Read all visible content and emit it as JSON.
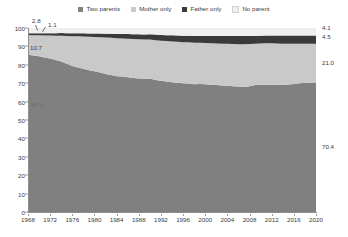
{
  "legend": {
    "position": "top-center",
    "items": [
      {
        "label": "Two parents",
        "color": "#808080",
        "icon": "square-swatch-icon"
      },
      {
        "label": "Mother only",
        "color": "#c9c9c9",
        "icon": "square-swatch-icon"
      },
      {
        "label": "Father only",
        "color": "#3a3a3a",
        "icon": "square-swatch-icon"
      },
      {
        "label": "No parent",
        "color": "#efefef",
        "icon": "square-swatch-icon"
      }
    ]
  },
  "axes": {
    "y_ticks": [
      "0",
      "10",
      "20",
      "30",
      "40",
      "50",
      "60",
      "70",
      "80",
      "90",
      "100"
    ],
    "x_ticks": [
      "1968",
      "1972",
      "1976",
      "1980",
      "1984",
      "1988",
      "1992",
      "1996",
      "2000",
      "2004",
      "2008",
      "2012",
      "2016",
      "2020"
    ]
  },
  "annotations": {
    "start": [
      {
        "name": "no-parent-start",
        "text": "2.8"
      },
      {
        "name": "father-only-start",
        "text": "1.1"
      },
      {
        "name": "mother-only-start",
        "text": "10.7"
      },
      {
        "name": "two-parents-start",
        "text": "85.4"
      }
    ],
    "end": [
      {
        "name": "no-parent-end",
        "text": "4.1"
      },
      {
        "name": "father-only-end",
        "text": "4.5"
      },
      {
        "name": "mother-only-end",
        "text": "21.0"
      },
      {
        "name": "two-parents-end",
        "text": "70.4"
      }
    ]
  },
  "chart_data": {
    "type": "area",
    "title": "",
    "subtitle": "",
    "xlabel": "",
    "ylabel": "",
    "xlim": [
      1968,
      2020
    ],
    "ylim": [
      0,
      100
    ],
    "grid": false,
    "stacked": true,
    "stack_order_bottom_to_top": [
      "Two parents",
      "Mother only",
      "Father only",
      "No parent"
    ],
    "legend_position": "top-center",
    "x": [
      1968,
      1969,
      1970,
      1971,
      1972,
      1973,
      1974,
      1975,
      1976,
      1977,
      1978,
      1979,
      1980,
      1981,
      1982,
      1983,
      1984,
      1985,
      1986,
      1987,
      1988,
      1989,
      1990,
      1991,
      1992,
      1993,
      1994,
      1995,
      1996,
      1997,
      1998,
      1999,
      2000,
      2001,
      2002,
      2003,
      2004,
      2005,
      2006,
      2007,
      2008,
      2009,
      2010,
      2011,
      2012,
      2013,
      2014,
      2015,
      2016,
      2017,
      2018,
      2019,
      2020
    ],
    "series": [
      {
        "name": "Two parents",
        "color": "#808080",
        "start_value": 85.4,
        "end_value": 70.4,
        "values": [
          85.4,
          85.0,
          84.6,
          84.0,
          83.4,
          82.6,
          81.8,
          80.6,
          79.4,
          78.6,
          77.8,
          77.0,
          76.5,
          75.8,
          75.0,
          74.4,
          73.8,
          73.6,
          73.2,
          72.8,
          72.6,
          72.4,
          72.5,
          71.8,
          71.3,
          70.9,
          70.5,
          70.2,
          70.0,
          69.8,
          69.4,
          69.6,
          69.4,
          69.2,
          69.0,
          68.8,
          68.6,
          68.4,
          68.2,
          68.0,
          68.4,
          69.0,
          69.2,
          69.1,
          69.0,
          69.1,
          69.2,
          69.3,
          69.6,
          70.0,
          70.2,
          70.3,
          70.4
        ]
      },
      {
        "name": "Mother only",
        "color": "#c9c9c9",
        "start_value": 10.7,
        "end_value": 21.0,
        "values": [
          10.7,
          11.0,
          11.4,
          11.9,
          12.5,
          13.2,
          14.0,
          15.0,
          16.1,
          16.9,
          17.6,
          18.2,
          18.6,
          19.2,
          19.8,
          20.3,
          20.6,
          20.7,
          21.0,
          21.2,
          21.3,
          21.3,
          21.2,
          21.6,
          21.8,
          22.0,
          22.2,
          22.3,
          22.3,
          22.4,
          22.6,
          22.4,
          22.4,
          22.5,
          22.6,
          22.7,
          22.8,
          22.9,
          23.0,
          23.2,
          22.9,
          22.5,
          22.4,
          22.6,
          22.7,
          22.5,
          22.3,
          22.2,
          21.9,
          21.5,
          21.3,
          21.1,
          21.0
        ]
      },
      {
        "name": "Father only",
        "color": "#3a3a3a",
        "start_value": 1.1,
        "end_value": 4.5,
        "values": [
          1.1,
          1.2,
          1.2,
          1.3,
          1.3,
          1.4,
          1.5,
          1.5,
          1.6,
          1.7,
          1.7,
          1.8,
          1.9,
          2.0,
          2.1,
          2.2,
          2.3,
          2.4,
          2.5,
          2.6,
          2.7,
          2.8,
          2.9,
          3.0,
          3.1,
          3.2,
          3.3,
          3.4,
          3.5,
          3.6,
          3.7,
          3.8,
          3.9,
          4.0,
          4.1,
          4.2,
          4.3,
          4.4,
          4.4,
          4.4,
          4.3,
          4.2,
          4.2,
          4.2,
          4.2,
          4.3,
          4.4,
          4.4,
          4.4,
          4.4,
          4.4,
          4.5,
          4.5
        ]
      },
      {
        "name": "No parent",
        "color": "#efefef",
        "start_value": 2.8,
        "end_value": 4.1,
        "values": [
          2.8,
          2.8,
          2.8,
          2.8,
          2.8,
          2.8,
          2.7,
          2.9,
          2.9,
          2.8,
          2.9,
          3.0,
          3.0,
          3.0,
          3.1,
          3.1,
          3.3,
          3.3,
          3.3,
          3.4,
          3.4,
          3.5,
          3.4,
          3.6,
          3.8,
          3.9,
          4.0,
          4.1,
          4.2,
          4.2,
          4.3,
          4.2,
          4.3,
          4.3,
          4.3,
          4.3,
          4.3,
          4.3,
          4.4,
          4.4,
          4.4,
          4.3,
          4.2,
          4.1,
          4.1,
          4.1,
          4.1,
          4.1,
          4.1,
          4.1,
          4.1,
          4.1,
          4.1
        ]
      }
    ]
  }
}
